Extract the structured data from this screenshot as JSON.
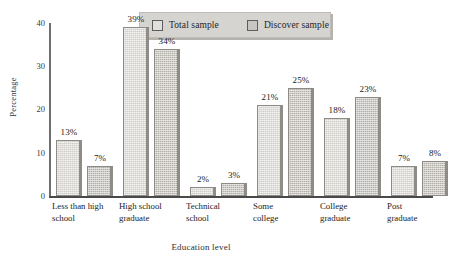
{
  "chart_data": {
    "type": "bar",
    "title": "",
    "xlabel": "Education level",
    "ylabel": "Percentage",
    "ylim": [
      0,
      40
    ],
    "yticks": [
      "0",
      "10",
      "20",
      "30",
      "40"
    ],
    "grid": false,
    "legend_position": "top-center",
    "categories": [
      "Less than high school",
      "High school graduate",
      "Technical school",
      "Some college",
      "College graduate",
      "Post graduate"
    ],
    "category_lines": [
      [
        "Less than high",
        "school"
      ],
      [
        "High school",
        "graduate"
      ],
      [
        "Technical",
        "school"
      ],
      [
        "Some",
        "college"
      ],
      [
        "College",
        "graduate"
      ],
      [
        "Post",
        "graduate"
      ]
    ],
    "series": [
      {
        "name": "Total sample",
        "color": "#cfcdc8",
        "values": [
          13,
          39,
          2,
          21,
          18,
          7
        ],
        "labels": [
          "13%",
          "39%",
          "2%",
          "21%",
          "18%",
          "7%"
        ]
      },
      {
        "name": "Discover sample",
        "color": "#b2afa9",
        "values": [
          7,
          34,
          3,
          25,
          23,
          8
        ],
        "labels": [
          "7%",
          "34%",
          "3%",
          "25%",
          "23%",
          "8%"
        ]
      }
    ]
  },
  "legend": {
    "items": [
      {
        "label": "Total sample",
        "swatch": "total"
      },
      {
        "label": "Discover sample",
        "swatch": "discover"
      }
    ]
  }
}
